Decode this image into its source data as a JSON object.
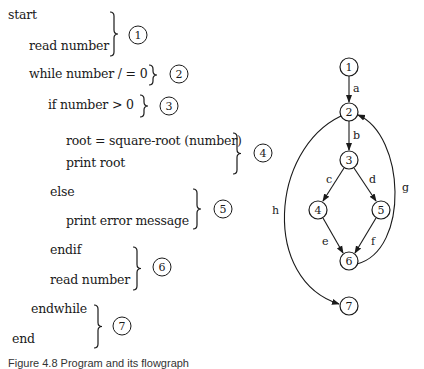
{
  "program": {
    "lines": [
      {
        "text": "start",
        "x": 8,
        "y": 11
      },
      {
        "text": "read number",
        "x": 29,
        "y": 42
      },
      {
        "text": "while number / = 0",
        "x": 29,
        "y": 70
      },
      {
        "text": "if number > 0",
        "x": 48,
        "y": 101
      },
      {
        "text": "root = square-root (number)",
        "x": 66,
        "y": 137
      },
      {
        "text": "print root",
        "x": 66,
        "y": 159
      },
      {
        "text": "else",
        "x": 50,
        "y": 188
      },
      {
        "text": "print error message",
        "x": 66,
        "y": 217
      },
      {
        "text": "endif",
        "x": 50,
        "y": 246
      },
      {
        "text": "read number",
        "x": 50,
        "y": 276
      },
      {
        "text": "endwhile",
        "x": 31,
        "y": 305
      },
      {
        "text": "end",
        "x": 12,
        "y": 335
      }
    ],
    "blocks": [
      {
        "label": "1",
        "brace_x": 113,
        "brace_top": 12,
        "brace_bottom": 56,
        "cx": 138,
        "cy": 35
      },
      {
        "label": "2",
        "brace_x": 152,
        "brace_top": 65,
        "brace_bottom": 85,
        "cx": 179,
        "cy": 74
      },
      {
        "label": "3",
        "brace_x": 143,
        "brace_top": 95,
        "brace_bottom": 117,
        "cx": 169,
        "cy": 106
      },
      {
        "label": "4",
        "brace_x": 236,
        "brace_top": 133,
        "brace_bottom": 174,
        "cx": 263,
        "cy": 153
      },
      {
        "label": "5",
        "brace_x": 196,
        "brace_top": 189,
        "brace_bottom": 229,
        "cx": 223,
        "cy": 209
      },
      {
        "label": "6",
        "brace_x": 136,
        "brace_top": 247,
        "brace_bottom": 290,
        "cx": 162,
        "cy": 267
      },
      {
        "label": "7",
        "brace_x": 97,
        "brace_top": 305,
        "brace_bottom": 348,
        "cx": 122,
        "cy": 326
      }
    ]
  },
  "flowgraph": {
    "nodes": [
      {
        "id": "1",
        "x": 349,
        "y": 67
      },
      {
        "id": "2",
        "x": 349,
        "y": 112
      },
      {
        "id": "3",
        "x": 349,
        "y": 160
      },
      {
        "id": "4",
        "x": 318,
        "y": 210
      },
      {
        "id": "5",
        "x": 381,
        "y": 210
      },
      {
        "id": "6",
        "x": 349,
        "y": 261
      },
      {
        "id": "7",
        "x": 349,
        "y": 306
      }
    ],
    "edges": [
      {
        "label": "a",
        "from": "1",
        "to": "2"
      },
      {
        "label": "b",
        "from": "2",
        "to": "3"
      },
      {
        "label": "c",
        "from": "3",
        "to": "4"
      },
      {
        "label": "d",
        "from": "3",
        "to": "5"
      },
      {
        "label": "e",
        "from": "4",
        "to": "6"
      },
      {
        "label": "f",
        "from": "5",
        "to": "6"
      },
      {
        "label": "g",
        "from": "6",
        "to": "2"
      },
      {
        "label": "h",
        "from": "2",
        "to": "7"
      }
    ]
  },
  "caption": "Figure 4.8 Program and its flowgraph"
}
